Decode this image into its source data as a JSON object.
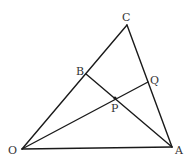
{
  "diagram": {
    "type": "geometry",
    "colors": {
      "line": "#1a1a1a",
      "label": "#333333",
      "background": "#ffffff"
    },
    "points": {
      "O": {
        "label": "O",
        "x": 22,
        "y": 149
      },
      "A": {
        "label": "A",
        "x": 172,
        "y": 147
      },
      "C": {
        "label": "C",
        "x": 127,
        "y": 25
      },
      "B": {
        "label": "B",
        "x": 86,
        "y": 74
      },
      "Q": {
        "label": "Q",
        "x": 148,
        "y": 82
      },
      "P": {
        "label": "P",
        "x": 115,
        "y": 98
      }
    },
    "segments": [
      {
        "from": "O",
        "to": "A"
      },
      {
        "from": "O",
        "to": "C"
      },
      {
        "from": "C",
        "to": "A"
      },
      {
        "from": "B",
        "to": "A"
      },
      {
        "from": "O",
        "to": "Q"
      }
    ],
    "labels": {
      "O": "O",
      "A": "A",
      "C": "C",
      "B": "B",
      "Q": "Q",
      "P": "P"
    }
  }
}
